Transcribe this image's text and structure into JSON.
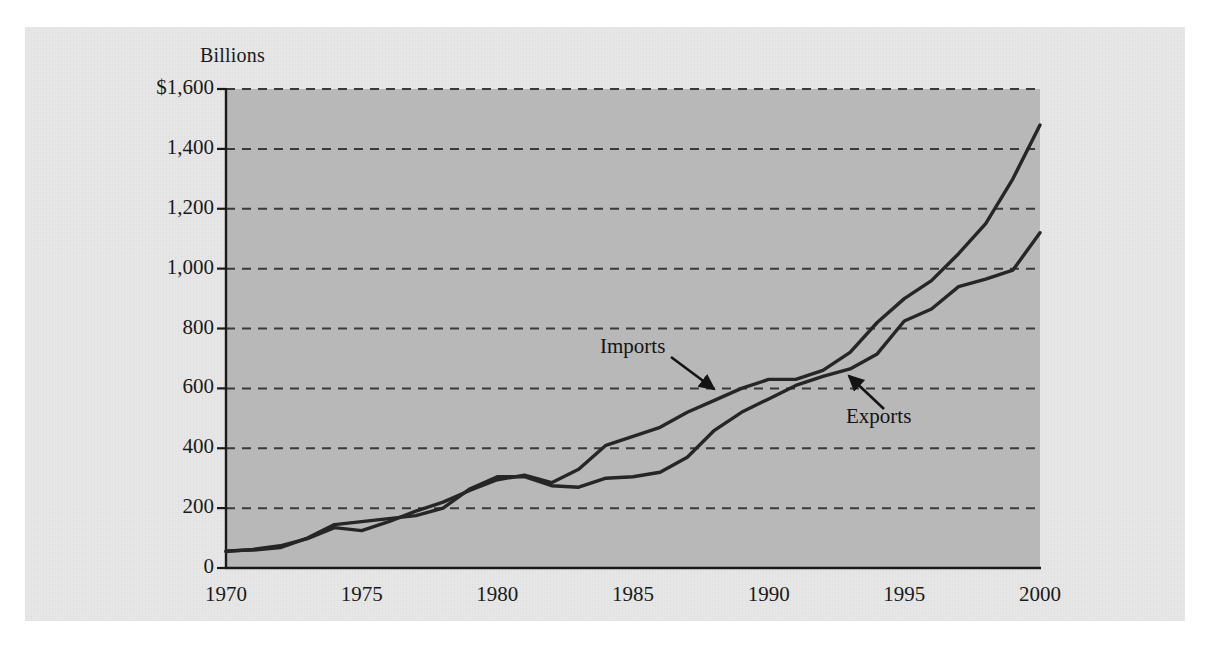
{
  "figure": {
    "axis_title": "Billions",
    "background": "#e8e8e8",
    "plot_background": "#b8b8b8"
  },
  "annotations": [
    {
      "name": "imports",
      "label": "Imports"
    },
    {
      "name": "exports",
      "label": "Exports"
    }
  ],
  "chart_data": {
    "type": "line",
    "title": "",
    "subtitle": "",
    "xlabel": "",
    "ylabel": "Billions",
    "ylim": [
      0,
      1600
    ],
    "xlim": [
      1970,
      2000
    ],
    "grid": true,
    "grid_style": "dashed-horizontal",
    "legend": "inline-annotations",
    "ytick_labels": [
      "$1,600",
      "1,400",
      "1,200",
      "1,000",
      "800",
      "600",
      "400",
      "200",
      "0"
    ],
    "yticks": [
      1600,
      1400,
      1200,
      1000,
      800,
      600,
      400,
      200,
      0
    ],
    "xtick_labels": [
      "1970",
      "1975",
      "1980",
      "1985",
      "1990",
      "1995",
      "2000"
    ],
    "xticks": [
      1970,
      1975,
      1980,
      1985,
      1990,
      1995,
      2000
    ],
    "x": [
      1970,
      1971,
      1972,
      1973,
      1974,
      1975,
      1976,
      1977,
      1978,
      1979,
      1980,
      1981,
      1982,
      1983,
      1984,
      1985,
      1986,
      1987,
      1988,
      1989,
      1990,
      1991,
      1992,
      1993,
      1994,
      1995,
      1996,
      1997,
      1998,
      1999,
      2000
    ],
    "series": [
      {
        "name": "Imports",
        "color": "#262626",
        "values": [
          55,
          62,
          74,
          98,
          135,
          125,
          155,
          190,
          220,
          260,
          295,
          310,
          285,
          330,
          410,
          440,
          470,
          520,
          560,
          600,
          630,
          630,
          660,
          720,
          820,
          900,
          960,
          1050,
          1150,
          1300,
          1480
        ]
      },
      {
        "name": "Exports",
        "color": "#262626",
        "values": [
          57,
          60,
          68,
          100,
          145,
          155,
          165,
          175,
          200,
          265,
          305,
          305,
          275,
          270,
          300,
          305,
          320,
          370,
          460,
          520,
          565,
          610,
          640,
          665,
          715,
          825,
          865,
          940,
          965,
          995,
          1120
        ]
      }
    ]
  }
}
